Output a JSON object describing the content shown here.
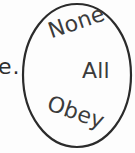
{
  "figure": {
    "type": "hand-drawn-diagram",
    "background_color": "#fdfdfd",
    "stroke_color": "#2b2b2b",
    "text_color": "#3b3b3b"
  },
  "shape": {
    "name": "ellipse-outline",
    "label": "circle",
    "center_x": 77,
    "center_y": 75,
    "radius_x": 54,
    "radius_y": 71,
    "stroke_width": 2.2
  },
  "words": {
    "none": "None",
    "all": "All",
    "obey": "Obey"
  },
  "rotations": {
    "none": -19,
    "all": 0,
    "obey": 19
  },
  "edge_text": {
    "fragment": "e."
  }
}
